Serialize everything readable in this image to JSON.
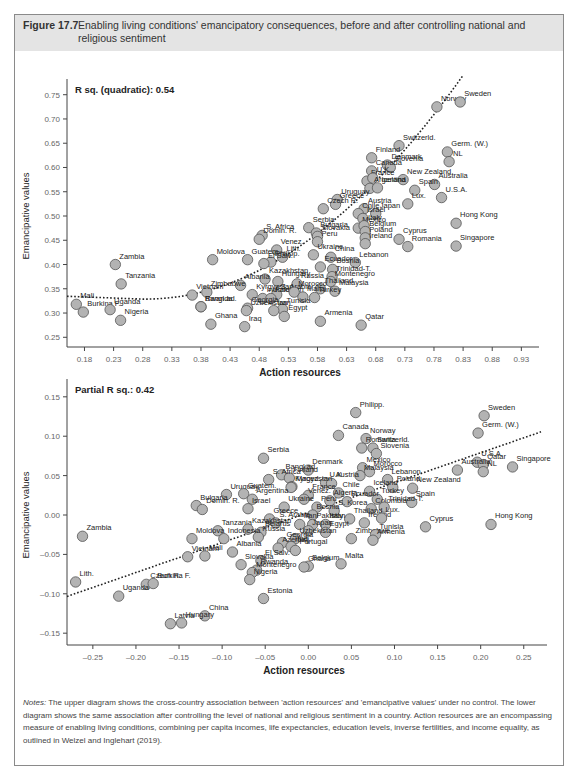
{
  "figure": {
    "label": "Figure 17.7",
    "title": "Enabling living conditions' emancipatory consequences, before and after controlling national and religious sentiment"
  },
  "notes": {
    "prefix": "Notes:",
    "text": " The upper diagram shows the cross-country association between 'action resources' and 'emancipative values' under no control. The lower diagram shows the same association after controlling the level of national and religious sentiment in a country. Action resources are an encompassing measure of enabling living conditions, combining per capita incomes, life expectancies, education levels, inverse fertilities, and income equality, as outlined in Welzel and Inglehart (2019)."
  },
  "colors": {
    "point_fill": "#b3b3b3",
    "point_stroke": "#555555",
    "header_bg": "#e4e4e4",
    "border": "#8a8a8a"
  },
  "chart_data": [
    {
      "type": "scatter",
      "title": "",
      "annotation": "R sq. (quadratic): 0.54",
      "xlabel": "Action resources",
      "ylabel": "Emancipative values",
      "xlim": [
        0.15,
        0.95
      ],
      "ylim": [
        0.23,
        0.77
      ],
      "xticks": [
        "0.18",
        "0.23",
        "0.28",
        "0.33",
        "0.38",
        "0.43",
        "0.48",
        "0.53",
        "0.58",
        "0.63",
        "0.68",
        "0.73",
        "0.78",
        "0.83",
        "0.88",
        "0.93"
      ],
      "yticks": [
        "0.25",
        "0.30",
        "0.35",
        "0.40",
        "0.45",
        "0.50",
        "0.55",
        "0.60",
        "0.65",
        "0.70",
        "0.75"
      ],
      "fit": "quadratic dotted",
      "grid": false,
      "points": [
        {
          "label": "Norway",
          "x": 0.785,
          "y": 0.725
        },
        {
          "label": "Sweden",
          "x": 0.825,
          "y": 0.735
        },
        {
          "label": "Switzerld.",
          "x": 0.72,
          "y": 0.645
        },
        {
          "label": "Germ. (W.)",
          "x": 0.803,
          "y": 0.632
        },
        {
          "label": "NL",
          "x": 0.806,
          "y": 0.612
        },
        {
          "label": "Finland",
          "x": 0.673,
          "y": 0.62
        },
        {
          "label": "Denmark",
          "x": 0.7,
          "y": 0.605
        },
        {
          "label": "Slovenia",
          "x": 0.705,
          "y": 0.6
        },
        {
          "label": "Canada",
          "x": 0.673,
          "y": 0.593
        },
        {
          "label": "New Zealand",
          "x": 0.727,
          "y": 0.575
        },
        {
          "label": "Australia",
          "x": 0.781,
          "y": 0.565
        },
        {
          "label": "France",
          "x": 0.665,
          "y": 0.572
        },
        {
          "label": "U.K.",
          "x": 0.675,
          "y": 0.578
        },
        {
          "label": "Spain",
          "x": 0.747,
          "y": 0.553
        },
        {
          "label": "Argentina",
          "x": 0.67,
          "y": 0.557
        },
        {
          "label": "Iceland",
          "x": 0.683,
          "y": 0.558
        },
        {
          "label": "U.S.A.",
          "x": 0.793,
          "y": 0.538
        },
        {
          "label": "Lux.",
          "x": 0.735,
          "y": 0.525
        },
        {
          "label": "Uruguay",
          "x": 0.614,
          "y": 0.534
        },
        {
          "label": "Greece",
          "x": 0.611,
          "y": 0.524
        },
        {
          "label": "Austria",
          "x": 0.66,
          "y": 0.515
        },
        {
          "label": "Czech R.",
          "x": 0.59,
          "y": 0.515
        },
        {
          "label": "Chile",
          "x": 0.65,
          "y": 0.505
        },
        {
          "label": "Japan",
          "x": 0.68,
          "y": 0.505
        },
        {
          "label": "Israel",
          "x": 0.658,
          "y": 0.495
        },
        {
          "label": "Mexico",
          "x": 0.65,
          "y": 0.475
        },
        {
          "label": "Italy",
          "x": 0.66,
          "y": 0.48
        },
        {
          "label": "Hong Kong",
          "x": 0.818,
          "y": 0.485
        },
        {
          "label": "Belgium",
          "x": 0.662,
          "y": 0.468
        },
        {
          "label": "Poland",
          "x": 0.662,
          "y": 0.455
        },
        {
          "label": "Cyprus",
          "x": 0.72,
          "y": 0.452
        },
        {
          "label": "Singapore",
          "x": 0.818,
          "y": 0.438
        },
        {
          "label": "Ireland",
          "x": 0.662,
          "y": 0.443
        },
        {
          "label": "Romania",
          "x": 0.735,
          "y": 0.437
        },
        {
          "label": "Serbia",
          "x": 0.565,
          "y": 0.476
        },
        {
          "label": "Bulgaria",
          "x": 0.578,
          "y": 0.465
        },
        {
          "label": "Slovakia",
          "x": 0.58,
          "y": 0.458
        },
        {
          "label": "Peru",
          "x": 0.58,
          "y": 0.447
        },
        {
          "label": "S. Africa",
          "x": 0.485,
          "y": 0.46
        },
        {
          "label": "Domin. R.",
          "x": 0.48,
          "y": 0.452
        },
        {
          "label": "Venez.",
          "x": 0.51,
          "y": 0.43
        },
        {
          "label": "Ukraine",
          "x": 0.573,
          "y": 0.42
        },
        {
          "label": "China",
          "x": 0.603,
          "y": 0.415
        },
        {
          "label": "Lebanon",
          "x": 0.645,
          "y": 0.404
        },
        {
          "label": "Guatem.",
          "x": 0.46,
          "y": 0.41
        },
        {
          "label": "Lith.",
          "x": 0.52,
          "y": 0.415
        },
        {
          "label": "Philipp.",
          "x": 0.5,
          "y": 0.405
        },
        {
          "label": "El Salv.",
          "x": 0.488,
          "y": 0.402
        },
        {
          "label": "Ecuador",
          "x": 0.585,
          "y": 0.395
        },
        {
          "label": "Bosnia",
          "x": 0.606,
          "y": 0.39
        },
        {
          "label": "Trinidad-T.",
          "x": 0.605,
          "y": 0.375
        },
        {
          "label": "Montenegro",
          "x": 0.603,
          "y": 0.365
        },
        {
          "label": "Hungary",
          "x": 0.512,
          "y": 0.365
        },
        {
          "label": "Kazakhstan",
          "x": 0.49,
          "y": 0.37
        },
        {
          "label": "Russia",
          "x": 0.545,
          "y": 0.36
        },
        {
          "label": "Thailand",
          "x": 0.585,
          "y": 0.35
        },
        {
          "label": "Malaysia",
          "x": 0.61,
          "y": 0.345
        },
        {
          "label": "Turkey",
          "x": 0.575,
          "y": 0.332
        },
        {
          "label": "Moldova",
          "x": 0.4,
          "y": 0.41
        },
        {
          "label": "Albania",
          "x": 0.448,
          "y": 0.357
        },
        {
          "label": "Kyrgyzstan",
          "x": 0.468,
          "y": 0.338
        },
        {
          "label": "S. Arabia",
          "x": 0.51,
          "y": 0.338
        },
        {
          "label": "Indonesia",
          "x": 0.486,
          "y": 0.33
        },
        {
          "label": "Zimbabwe",
          "x": 0.39,
          "y": 0.343
        },
        {
          "label": "Vietnam",
          "x": 0.365,
          "y": 0.337
        },
        {
          "label": "Pakistan",
          "x": 0.5,
          "y": 0.33
        },
        {
          "label": "Georgia",
          "x": 0.46,
          "y": 0.31
        },
        {
          "label": "Morocco",
          "x": 0.54,
          "y": 0.343
        },
        {
          "label": "Malta",
          "x": 0.555,
          "y": 0.333
        },
        {
          "label": "Tunisia",
          "x": 0.52,
          "y": 0.308
        },
        {
          "label": "Uzbekistan",
          "x": 0.458,
          "y": 0.305
        },
        {
          "label": "Egypt",
          "x": 0.523,
          "y": 0.293
        },
        {
          "label": "Iran",
          "x": 0.505,
          "y": 0.305
        },
        {
          "label": "Armenia",
          "x": 0.585,
          "y": 0.283
        },
        {
          "label": "Qatar",
          "x": 0.655,
          "y": 0.275
        },
        {
          "label": "Iraq",
          "x": 0.455,
          "y": 0.272
        },
        {
          "label": "Bangl.ad.",
          "x": 0.38,
          "y": 0.313
        },
        {
          "label": "Rwanda",
          "x": 0.38,
          "y": 0.313
        },
        {
          "label": "Ghana",
          "x": 0.397,
          "y": 0.277
        },
        {
          "label": "Zambia",
          "x": 0.233,
          "y": 0.4
        },
        {
          "label": "Tanzania",
          "x": 0.243,
          "y": 0.36
        },
        {
          "label": "Mali",
          "x": 0.166,
          "y": 0.318
        },
        {
          "label": "Burkina F.",
          "x": 0.178,
          "y": 0.302
        },
        {
          "label": "Uganda",
          "x": 0.224,
          "y": 0.307
        },
        {
          "label": "Nigeria",
          "x": 0.242,
          "y": 0.285
        }
      ]
    },
    {
      "type": "scatter",
      "title": "",
      "annotation": "Partial R sq.: 0.42",
      "xlabel": "Action resources",
      "ylabel": "Emancipative values",
      "xlim": [
        -0.28,
        0.27
      ],
      "ylim": [
        -0.165,
        0.165
      ],
      "xticks": [
        "-0.25",
        "-0.20",
        "-0.15",
        "-0.10",
        "-0.05",
        "0.00",
        "0.05",
        "0.10",
        "0.15",
        "0.20",
        "0.25"
      ],
      "yticks": [
        "-0.15",
        "-0.10",
        "-0.05",
        "0.00",
        "0.05",
        "0.10",
        "0.15"
      ],
      "fit": "linear dotted",
      "grid": false,
      "points": [
        {
          "label": "Philipp.",
          "x": 0.055,
          "y": 0.13
        },
        {
          "label": "Sweden",
          "x": 0.204,
          "y": 0.126
        },
        {
          "label": "Canada",
          "x": 0.035,
          "y": 0.101
        },
        {
          "label": "Norway",
          "x": 0.067,
          "y": 0.097
        },
        {
          "label": "Germ. (W.)",
          "x": 0.197,
          "y": 0.104
        },
        {
          "label": "Switzerld.",
          "x": 0.075,
          "y": 0.085
        },
        {
          "label": "Slovenia",
          "x": 0.079,
          "y": 0.078
        },
        {
          "label": "Romania",
          "x": 0.062,
          "y": 0.085
        },
        {
          "label": "Serbia",
          "x": -0.052,
          "y": 0.072
        },
        {
          "label": "U.S.A.",
          "x": 0.196,
          "y": 0.067
        },
        {
          "label": "Qatar",
          "x": 0.203,
          "y": 0.064
        },
        {
          "label": "NL",
          "x": 0.203,
          "y": 0.055
        },
        {
          "label": "Singapore",
          "x": 0.237,
          "y": 0.061
        },
        {
          "label": "Australia",
          "x": 0.173,
          "y": 0.057
        },
        {
          "label": "Mexico",
          "x": 0.063,
          "y": 0.06
        },
        {
          "label": "Morocco",
          "x": 0.071,
          "y": 0.055
        },
        {
          "label": "Lebanon",
          "x": 0.092,
          "y": 0.045
        },
        {
          "label": "Denmark",
          "x": 0.0,
          "y": 0.057
        },
        {
          "label": "Malaysia",
          "x": 0.06,
          "y": 0.05
        },
        {
          "label": "Bangl.ad.",
          "x": -0.031,
          "y": 0.051
        },
        {
          "label": "Finland",
          "x": -0.022,
          "y": 0.047
        },
        {
          "label": "S. Africa",
          "x": -0.046,
          "y": 0.045
        },
        {
          "label": "U.K.",
          "x": 0.02,
          "y": 0.041
        },
        {
          "label": "Austria",
          "x": 0.027,
          "y": 0.04
        },
        {
          "label": "New Zealand",
          "x": 0.121,
          "y": 0.034
        },
        {
          "label": "Poland",
          "x": 0.098,
          "y": 0.035
        },
        {
          "label": "Maced.",
          "x": -0.019,
          "y": 0.036
        },
        {
          "label": "Kyrgyzstan",
          "x": -0.02,
          "y": 0.035
        },
        {
          "label": "Iceland",
          "x": 0.071,
          "y": 0.03
        },
        {
          "label": "Chile",
          "x": 0.035,
          "y": 0.028
        },
        {
          "label": "Spain",
          "x": 0.12,
          "y": 0.016
        },
        {
          "label": "Turkey",
          "x": 0.08,
          "y": 0.02
        },
        {
          "label": "France",
          "x": 0.0,
          "y": 0.025
        },
        {
          "label": "Venez.",
          "x": -0.005,
          "y": 0.02
        },
        {
          "label": "Algeria",
          "x": 0.025,
          "y": 0.018
        },
        {
          "label": "Ecuador",
          "x": 0.045,
          "y": 0.017
        },
        {
          "label": "Colombia",
          "x": 0.073,
          "y": 0.008
        },
        {
          "label": "Trinidad-T.",
          "x": 0.088,
          "y": 0.01
        },
        {
          "label": "Uruguay",
          "x": -0.095,
          "y": 0.026
        },
        {
          "label": "Guatem.",
          "x": -0.075,
          "y": 0.027
        },
        {
          "label": "Argentina",
          "x": -0.065,
          "y": 0.02
        },
        {
          "label": "Bulgaria",
          "x": -0.13,
          "y": 0.012
        },
        {
          "label": "Domin. R.",
          "x": -0.123,
          "y": 0.007
        },
        {
          "label": "Ukraine",
          "x": -0.028,
          "y": 0.01
        },
        {
          "label": "Israel",
          "x": -0.07,
          "y": 0.008
        },
        {
          "label": "Peru",
          "x": 0.01,
          "y": 0.01
        },
        {
          "label": "S. Korea",
          "x": 0.03,
          "y": 0.005
        },
        {
          "label": "Bosnia",
          "x": 0.005,
          "y": 0.0
        },
        {
          "label": "Thailand",
          "x": 0.048,
          "y": -0.005
        },
        {
          "label": "Ireland",
          "x": 0.065,
          "y": -0.01
        },
        {
          "label": "Lux.",
          "x": 0.085,
          "y": -0.004
        },
        {
          "label": "Hong Kong",
          "x": 0.212,
          "y": -0.012
        },
        {
          "label": "Cyprus",
          "x": 0.136,
          "y": -0.015
        },
        {
          "label": "Greece",
          "x": -0.045,
          "y": -0.005
        },
        {
          "label": "S. Arabia",
          "x": -0.038,
          "y": -0.01
        },
        {
          "label": "Iran",
          "x": -0.01,
          "y": -0.012
        },
        {
          "label": "Pakistan",
          "x": 0.005,
          "y": -0.012
        },
        {
          "label": "Italy",
          "x": 0.02,
          "y": -0.012
        },
        {
          "label": "Japan",
          "x": 0.0,
          "y": -0.02
        },
        {
          "label": "Egypt",
          "x": 0.02,
          "y": -0.022
        },
        {
          "label": "Zimbabwe",
          "x": 0.05,
          "y": -0.03
        },
        {
          "label": "Tunisia",
          "x": 0.078,
          "y": -0.025
        },
        {
          "label": "Armenia",
          "x": 0.075,
          "y": -0.032
        },
        {
          "label": "Tanzania",
          "x": -0.105,
          "y": -0.02
        },
        {
          "label": "Kazakhstan",
          "x": -0.07,
          "y": -0.018
        },
        {
          "label": "Belarus",
          "x": -0.055,
          "y": -0.022
        },
        {
          "label": "Russia",
          "x": -0.058,
          "y": -0.028
        },
        {
          "label": "Uzbekistan",
          "x": -0.015,
          "y": -0.03
        },
        {
          "label": "Georgia",
          "x": -0.03,
          "y": -0.035
        },
        {
          "label": "Indonesia",
          "x": -0.098,
          "y": -0.03
        },
        {
          "label": "Moldova",
          "x": -0.135,
          "y": -0.03
        },
        {
          "label": "Azerbaij.",
          "x": -0.035,
          "y": -0.042
        },
        {
          "label": "Iraq",
          "x": -0.02,
          "y": -0.04
        },
        {
          "label": "Portugal",
          "x": -0.015,
          "y": -0.045
        },
        {
          "label": "El Salv.",
          "x": -0.055,
          "y": -0.058
        },
        {
          "label": "Albania",
          "x": -0.088,
          "y": -0.047
        },
        {
          "label": "Vietnam",
          "x": -0.14,
          "y": -0.053
        },
        {
          "label": "Mali",
          "x": -0.12,
          "y": -0.052
        },
        {
          "label": "Slovakia",
          "x": -0.078,
          "y": -0.063
        },
        {
          "label": "Rwanda",
          "x": -0.06,
          "y": -0.07
        },
        {
          "label": "Montenegro",
          "x": -0.065,
          "y": -0.073
        },
        {
          "label": "Nigeria",
          "x": -0.068,
          "y": -0.082
        },
        {
          "label": "Belgium",
          "x": 0.0,
          "y": -0.065
        },
        {
          "label": "Malta",
          "x": 0.038,
          "y": -0.062
        },
        {
          "label": "Ghana",
          "x": -0.005,
          "y": -0.066
        },
        {
          "label": "Estonia",
          "x": -0.052,
          "y": -0.106
        },
        {
          "label": "Zambia",
          "x": -0.262,
          "y": -0.027
        },
        {
          "label": "Lith.",
          "x": -0.27,
          "y": -0.085
        },
        {
          "label": "Czech R.",
          "x": -0.188,
          "y": -0.088
        },
        {
          "label": "Burkina F.",
          "x": -0.18,
          "y": -0.087
        },
        {
          "label": "Uganda",
          "x": -0.22,
          "y": -0.103
        },
        {
          "label": "China",
          "x": -0.12,
          "y": -0.128
        },
        {
          "label": "Latvia",
          "x": -0.16,
          "y": -0.138
        },
        {
          "label": "Hungary",
          "x": -0.147,
          "y": -0.137
        }
      ]
    }
  ]
}
